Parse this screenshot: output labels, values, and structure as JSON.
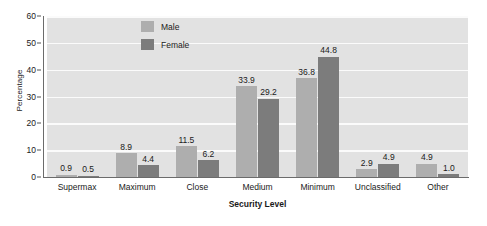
{
  "chart_data": {
    "type": "bar",
    "title": "",
    "xlabel": "Security Level",
    "ylabel": "Percentage",
    "categories": [
      "Supermax",
      "Maximum",
      "Close",
      "Medium",
      "Minimum",
      "Unclassified",
      "Other"
    ],
    "series": [
      {
        "name": "Male",
        "color": "#aeaeae",
        "values": [
          0.9,
          8.9,
          11.5,
          33.9,
          36.8,
          2.9,
          4.9
        ]
      },
      {
        "name": "Female",
        "color": "#7c7c7c",
        "values": [
          0.5,
          4.4,
          6.2,
          29.2,
          44.8,
          4.9,
          1.0
        ]
      }
    ],
    "value_labels": {
      "Male": [
        "0.9",
        "8.9",
        "11.5",
        "33.9",
        "36.8",
        "2.9",
        "4.9"
      ],
      "Female": [
        "0.5",
        "4.4",
        "6.2",
        "29.2",
        "44.8",
        "4.9",
        "1.0"
      ]
    },
    "ylim": [
      0,
      60
    ],
    "yticks": [
      0,
      10,
      20,
      30,
      40,
      50,
      60
    ],
    "ytick_labels": [
      "0",
      "10",
      "20",
      "30",
      "40",
      "50",
      "60"
    ],
    "grid": true,
    "grid_axis": "y",
    "legend_position": "top-left-inside",
    "plot_background": "#e2e2e2",
    "gridline_color": "#fbfbfb",
    "axis_color": "#6b6b6b",
    "figure_background": "#ffffff"
  },
  "legend": {
    "entries": [
      {
        "label": "Male",
        "color": "#aeaeae"
      },
      {
        "label": "Female",
        "color": "#7c7c7c"
      }
    ]
  },
  "caption": {
    "fragment": ""
  }
}
